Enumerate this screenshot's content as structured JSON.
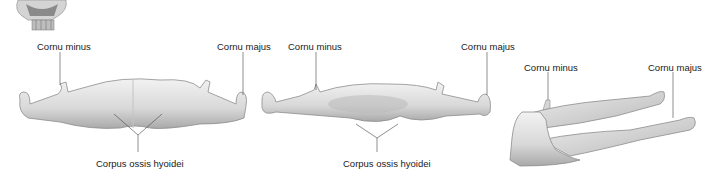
{
  "figure": {
    "views": [
      {
        "name": "anterior",
        "labels": {
          "cornu_minus": "Cornu minus",
          "cornu_majus": "Cornu majus",
          "corpus": "Corpus ossis hyoidei"
        }
      },
      {
        "name": "posterior",
        "labels": {
          "cornu_minus": "Cornu minus",
          "cornu_majus": "Cornu majus",
          "corpus": "Corpus ossis hyoidei"
        }
      },
      {
        "name": "lateral",
        "labels": {
          "cornu_minus": "Cornu minus",
          "cornu_majus": "Cornu majus"
        }
      }
    ],
    "colors": {
      "bone_light": "#ececec",
      "bone_mid": "#cfcfcf",
      "bone_dark": "#9a9a9a",
      "leader_line": "#444444",
      "text": "#1a1a1a"
    }
  }
}
